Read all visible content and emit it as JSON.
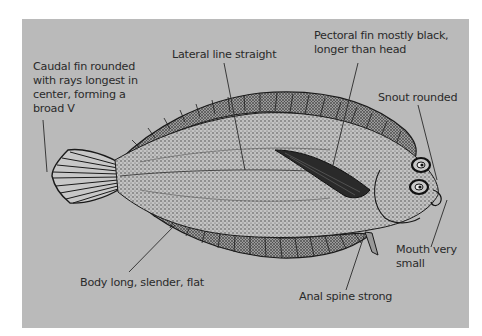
{
  "diagram": {
    "background_color": "#bababa",
    "ink_color": "#1a1a1a",
    "labels": {
      "caudal_fin": {
        "lines": [
          "Caudal fin rounded",
          "with rays longest in",
          "center, forming a",
          "broad V"
        ]
      },
      "lateral_line": {
        "text": "Lateral line straight"
      },
      "pectoral_fin": {
        "lines": [
          "Pectoral fin mostly black,",
          "longer than head"
        ]
      },
      "snout": {
        "text": "Snout rounded"
      },
      "mouth": {
        "lines": [
          "Mouth very",
          "small"
        ]
      },
      "body": {
        "text": "Body long, slender, flat"
      },
      "anal_spine": {
        "text": "Anal spine strong"
      }
    }
  }
}
